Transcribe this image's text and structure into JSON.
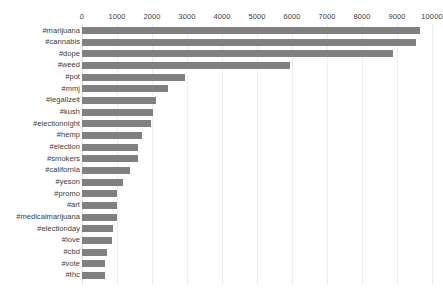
{
  "chart_data": {
    "type": "bar",
    "orientation": "horizontal",
    "title": "",
    "subtitle": "",
    "xlabel": "",
    "ylabel": "",
    "xlim": [
      0,
      10000
    ],
    "xticks": [
      0,
      1000,
      2000,
      3000,
      4000,
      5000,
      6000,
      7000,
      8000,
      9000,
      10000
    ],
    "xtick_labels": [
      "0",
      "1000",
      "2000",
      "3000",
      "4000",
      "5000",
      "6000",
      "7000",
      "8000",
      "9000",
      "10000"
    ],
    "grid": true,
    "grid_axis": "x",
    "legend": false,
    "legend_position": "none",
    "bar_color": "#808080",
    "categories": [
      "#marijuana",
      "#cannabis",
      "#dope",
      "#weed",
      "#pot",
      "#mmj",
      "#legalizeit",
      "#kush",
      "#electionnight",
      "#hemp",
      "#election",
      "#smokers",
      "#california",
      "#yeson",
      "#promo",
      "#art",
      "#medicalmarijuana",
      "#electionday",
      "#love",
      "#cbd",
      "#vote",
      "#thc"
    ],
    "values": [
      9660,
      9540,
      8880,
      5940,
      2940,
      2460,
      2110,
      2040,
      1970,
      1700,
      1590,
      1590,
      1370,
      1160,
      1010,
      1010,
      990,
      880,
      870,
      710,
      660,
      660
    ]
  },
  "colors": {
    "bar": "#808080",
    "grid": "#eceff1",
    "text": "#3b3b3b",
    "background": "#ffffff"
  }
}
